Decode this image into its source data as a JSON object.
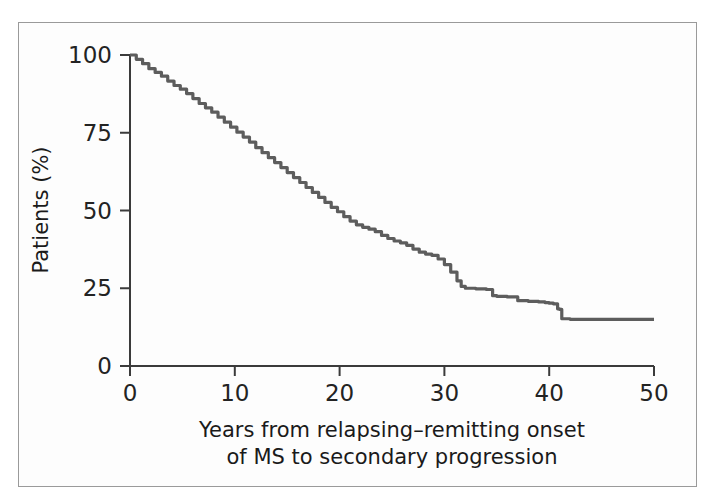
{
  "figure": {
    "frame_color": "#9a9a9a",
    "background_color": "#fdfdfd"
  },
  "chart_data": {
    "type": "line",
    "title": "",
    "subtitle": "",
    "xlabel_line1": "Years from relapsing–remitting onset",
    "xlabel_line2": "of MS to secondary progression",
    "ylabel": "Patients (%)",
    "xlim": [
      0,
      50
    ],
    "ylim": [
      0,
      100
    ],
    "grid": false,
    "legend": "none",
    "curve_color": "#5d5d5d",
    "axis_color": "#3b3b3b",
    "xticks": [
      0,
      10,
      20,
      30,
      40,
      50
    ],
    "xtick_labels": [
      "0",
      "10",
      "20",
      "30",
      "40",
      "50"
    ],
    "yticks": [
      0,
      25,
      50,
      75,
      100
    ],
    "ytick_labels": [
      "0",
      "25",
      "50",
      "75",
      "100"
    ],
    "series": [
      {
        "name": "Proportion free of secondary progression",
        "x": [
          0,
          0.6,
          1.2,
          1.8,
          2.4,
          3.0,
          3.6,
          4.2,
          4.8,
          5.4,
          6.0,
          6.6,
          7.2,
          7.8,
          8.4,
          9.0,
          9.6,
          10.2,
          10.8,
          11.4,
          12.0,
          12.6,
          13.2,
          13.8,
          14.4,
          15.0,
          15.6,
          16.2,
          16.8,
          17.4,
          18.0,
          18.6,
          19.2,
          19.8,
          20.4,
          21.0,
          21.6,
          22.2,
          22.8,
          23.4,
          24.0,
          24.6,
          25.2,
          25.8,
          26.4,
          27.0,
          27.6,
          28.2,
          28.8,
          29.4,
          30.0,
          30.6,
          31.2,
          31.6,
          32.0,
          33.0,
          34.0,
          34.6,
          35.0,
          36.0,
          37.0,
          38.0,
          39.0,
          39.6,
          40.0,
          40.4,
          40.8,
          41.0,
          41.2,
          42.0,
          44.0,
          46.0,
          48.0,
          50.0
        ],
        "values": [
          100,
          98.6,
          97.2,
          95.6,
          94.4,
          93.2,
          91.6,
          90.2,
          89.0,
          87.6,
          86.0,
          84.4,
          83.0,
          81.6,
          80.0,
          78.4,
          76.8,
          75.2,
          73.6,
          72.0,
          70.2,
          68.6,
          67.0,
          65.4,
          63.8,
          62.2,
          60.6,
          59.0,
          57.4,
          55.8,
          54.2,
          52.6,
          51.0,
          49.6,
          48.0,
          46.6,
          45.4,
          44.6,
          44.0,
          43.2,
          42.0,
          41.0,
          40.2,
          39.6,
          38.8,
          37.6,
          36.6,
          36.0,
          35.6,
          34.4,
          32.6,
          30.2,
          27.4,
          25.6,
          25.0,
          24.8,
          24.6,
          22.6,
          22.4,
          22.2,
          21.0,
          20.8,
          20.6,
          20.4,
          20.2,
          20.0,
          18.4,
          18.2,
          15.2,
          15.0,
          15.0,
          15.0,
          15.0,
          15.0
        ]
      }
    ],
    "annotations": {
      "start_value": "100",
      "plateau_value": "15",
      "plateau_starts_at_year": "41"
    }
  }
}
